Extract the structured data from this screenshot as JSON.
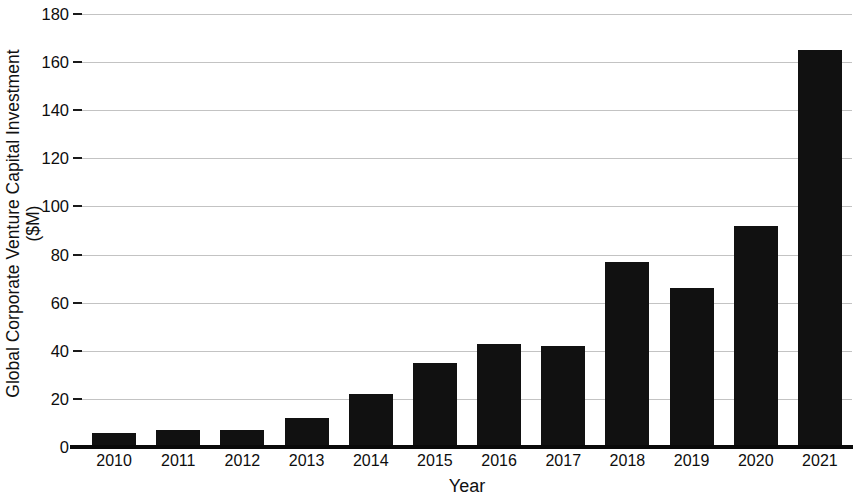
{
  "chart_data": {
    "type": "bar",
    "title": "",
    "xlabel": "Year",
    "ylabel": "Global Corporate Venture Capital Investment ($M)",
    "ylabel_line1": "Global Corporate Venture Capital Investment",
    "ylabel_line2": "($M)",
    "categories": [
      "2010",
      "2011",
      "2012",
      "2013",
      "2014",
      "2015",
      "2016",
      "2017",
      "2018",
      "2019",
      "2020",
      "2021"
    ],
    "values": [
      6,
      7,
      7,
      12,
      22,
      35,
      43,
      42,
      77,
      66,
      92,
      165
    ],
    "ylim": [
      0,
      180
    ],
    "ytick_labels": [
      "0",
      "20",
      "40",
      "60",
      "80",
      "100",
      "120",
      "140",
      "160",
      "180"
    ],
    "ytick_values": [
      0,
      20,
      40,
      60,
      80,
      100,
      120,
      140,
      160,
      180
    ],
    "grid": "horizontal",
    "legend": "none",
    "bar_color": "#111111",
    "grid_color": "#b9b9b9",
    "axis_color": "#0a0a0a"
  }
}
